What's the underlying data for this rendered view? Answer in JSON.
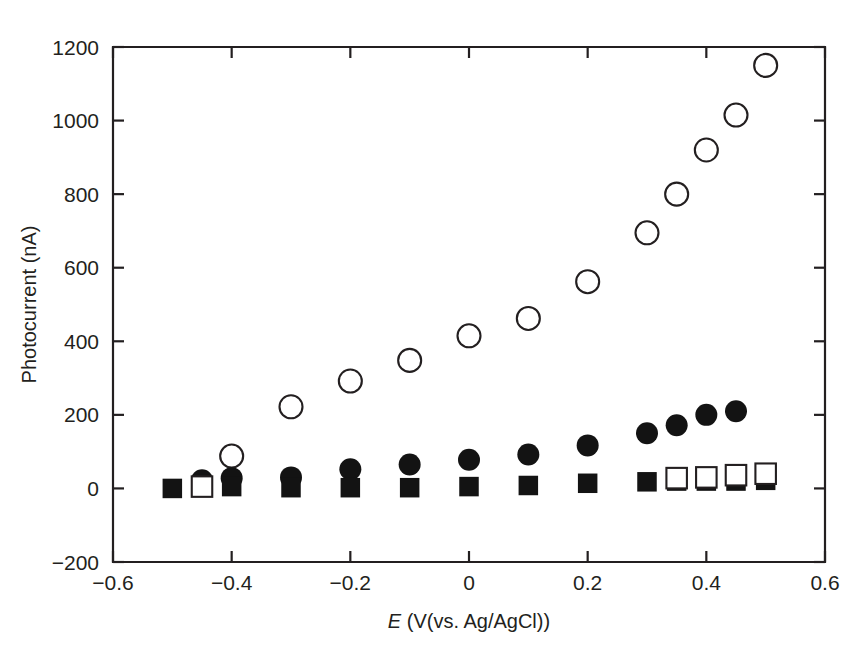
{
  "chart_data": {
    "type": "scatter",
    "title": "",
    "xlabel_italic": "E",
    "xlabel_rest": " (V(vs. Ag/AgCl))",
    "ylabel": "Photocurrent (nA)",
    "xlim": [
      -0.6,
      0.6
    ],
    "ylim": [
      -200,
      1200
    ],
    "xticks": [
      -0.6,
      -0.4,
      -0.2,
      0,
      0.2,
      0.4,
      0.6
    ],
    "xticklabels": [
      "−0.6",
      "−0.4",
      "−0.2",
      "0",
      "0.2",
      "0.4",
      "0.6"
    ],
    "yticks": [
      -200,
      0,
      200,
      400,
      600,
      800,
      1000,
      1200
    ],
    "yticklabels": [
      "−200",
      "0",
      "200",
      "400",
      "600",
      "800",
      "1000",
      "1200"
    ],
    "grid": false,
    "legend": "none",
    "series": [
      {
        "name": "open-circles",
        "marker": "circle-open",
        "x": [
          -0.4,
          -0.3,
          -0.2,
          -0.1,
          0.0,
          0.1,
          0.2,
          0.3,
          0.35,
          0.4,
          0.45,
          0.5
        ],
        "y": [
          88,
          222,
          292,
          348,
          415,
          462,
          562,
          695,
          800,
          920,
          1015,
          1150
        ]
      },
      {
        "name": "filled-circles",
        "marker": "circle-filled",
        "x": [
          -0.45,
          -0.4,
          -0.3,
          -0.2,
          -0.1,
          0.0,
          0.1,
          0.2,
          0.3,
          0.35,
          0.4,
          0.45
        ],
        "y": [
          22,
          28,
          30,
          52,
          65,
          78,
          92,
          117,
          150,
          172,
          200,
          210
        ]
      },
      {
        "name": "filled-squares",
        "marker": "square-filled",
        "x": [
          -0.5,
          -0.4,
          -0.3,
          -0.2,
          -0.1,
          0.0,
          0.1,
          0.2,
          0.3,
          0.35,
          0.4,
          0.45,
          0.5
        ],
        "y": [
          0,
          5,
          2,
          2,
          2,
          5,
          8,
          14,
          18,
          20,
          20,
          20,
          22
        ]
      },
      {
        "name": "open-squares",
        "marker": "square-open",
        "x": [
          -0.45,
          0.35,
          0.4,
          0.45,
          0.5
        ],
        "y": [
          5,
          28,
          30,
          36,
          40
        ]
      }
    ]
  }
}
